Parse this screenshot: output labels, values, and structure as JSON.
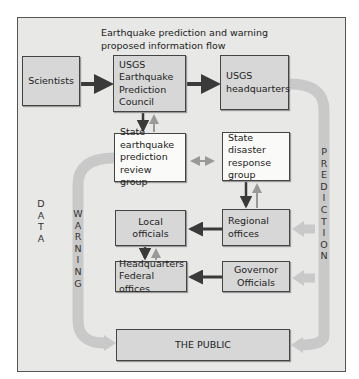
{
  "title": {
    "line1": "Earthquake prediction and warning",
    "line2": "proposed information flow"
  },
  "nodes": {
    "scientists": "Scientists",
    "council": [
      "USGS",
      "Earthquake",
      "Prediction",
      "Council"
    ],
    "usgs_hq": [
      "USGS",
      "headquarters"
    ],
    "state_review": [
      "State",
      "earthquake",
      "prediction",
      "review group"
    ],
    "state_disaster": [
      "State",
      "disaster",
      "response",
      "group"
    ],
    "local_officials": [
      "Local",
      "officials"
    ],
    "regional_offices": [
      "Regional",
      "offices"
    ],
    "hq_federal": [
      "Headquarters",
      "Federal offices"
    ],
    "governor": [
      "Governor",
      "Officials"
    ],
    "public": "THE PUBLIC"
  },
  "flow_labels": {
    "data": [
      "D",
      "A",
      "T",
      "A"
    ],
    "warning": [
      "W",
      "A",
      "R",
      "N",
      "I",
      "N",
      "G"
    ],
    "prediction": [
      "P",
      "R",
      "E",
      "D",
      "I",
      "C",
      "T",
      "I",
      "O",
      "N"
    ]
  },
  "colors": {
    "frame_bg": "#e8e8e6",
    "shaded_box": "#d7d7d7",
    "white_box": "#fafaf8",
    "flow_band": "#c9c9c9",
    "dark_arrow": "#3a3a3a"
  }
}
